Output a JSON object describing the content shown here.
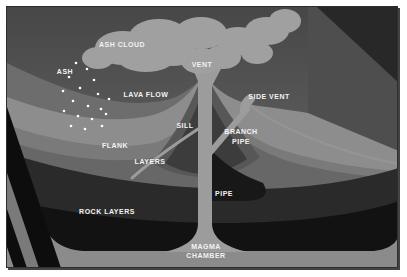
{
  "figure": {
    "type": "volcano-cutaway-cross-section",
    "labels": {
      "ash_cloud": {
        "text": "ASH CLOUD"
      },
      "ash": {
        "text": "ASH"
      },
      "vent": {
        "text": "VENT"
      },
      "lava_flow": {
        "text": "LAVA FLOW"
      },
      "side_vent": {
        "text": "SIDE VENT"
      },
      "sill": {
        "text": "SILL"
      },
      "branch_pipe": {
        "lines": [
          "BRANCH",
          "PIPE"
        ]
      },
      "flank": {
        "text": "FLANK"
      },
      "layers": {
        "text": "LAYERS"
      },
      "pipe": {
        "text": "PIPE"
      },
      "rock_layers": {
        "text": "ROCK LAYERS"
      },
      "magma_chamber": {
        "lines": [
          "MAGMA",
          "CHAMBER"
        ]
      }
    },
    "colors": {
      "page_bg": "#ffffff",
      "sky_top": "#474747",
      "sky_bottom": "#666666",
      "wall": "#4e4e4e",
      "wall_shadow": "#282828",
      "upper_slope": "#6d6d6d",
      "surface": "#8d8d8d",
      "flank_band": "#7a7a7a",
      "layers_band": "#676767",
      "cone_mid": "#575757",
      "cone_inner": "#3c3c3c",
      "rock_upper": "#2a2a2a",
      "rock_lower": "#121212",
      "magma": "#8b8b8b",
      "conduit": "#9c9c9c",
      "cloud": "#a0a0a0",
      "ash_dots": "#ffffff",
      "left_face_dark": "#0d0d0d",
      "left_face_gray": "#7a7a7a",
      "label_text": "#f2f2f2"
    }
  }
}
